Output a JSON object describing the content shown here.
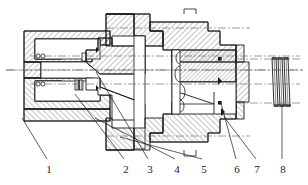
{
  "figure": {
    "kind": "mechanical-cross-section",
    "title": "",
    "background_color": "#ffffff",
    "line_color": "#1a1a1a",
    "hatch_color": "#3a3a3a",
    "centerline_color": "#555555",
    "width": 308,
    "height": 185
  },
  "callouts": [
    {
      "id": "1",
      "label": "1",
      "text_x": 42,
      "text_y": 163,
      "leader": {
        "x1": 47,
        "y1": 159,
        "x2": 22,
        "y2": 118
      }
    },
    {
      "id": "2",
      "label": "2",
      "text_x": 119,
      "text_y": 163,
      "leader": {
        "x1": 124,
        "y1": 159,
        "x2": 75,
        "y2": 94
      }
    },
    {
      "id": "3",
      "label": "3",
      "text_x": 143,
      "text_y": 163,
      "leader": {
        "x1": 148,
        "y1": 159,
        "x2": 96,
        "y2": 72
      }
    },
    {
      "id": "4",
      "label": "4",
      "text_x": 170,
      "text_y": 163,
      "leader": {
        "x1": 175,
        "y1": 159,
        "x2": 95,
        "y2": 118
      }
    },
    {
      "id": "5",
      "label": "5",
      "text_x": 197,
      "text_y": 163,
      "leader": {
        "x1": 202,
        "y1": 159,
        "x2": 120,
        "y2": 137
      }
    },
    {
      "id": "6",
      "label": "6",
      "text_x": 232,
      "text_y": 163,
      "leader": {
        "x1": 236,
        "y1": 159,
        "x2": 221,
        "y2": 103
      }
    },
    {
      "id": "7",
      "label": "7",
      "text_x": 253,
      "text_y": 163,
      "leader": {
        "x1": 256,
        "y1": 159,
        "x2": 224,
        "y2": 117
      }
    },
    {
      "id": "8",
      "label": "8",
      "text_x": 279,
      "text_y": 163,
      "leader": {
        "x1": 282,
        "y1": 159,
        "x2": 282,
        "y2": 106
      }
    }
  ],
  "components": {
    "left_housing": "left end housing body",
    "inner_sleeve": "inner sleeve / bushing",
    "seal_ring": "o-ring seal",
    "piston": "tapered piston / cone",
    "main_body": "main valve body",
    "right_sleeve": "right seat sleeve",
    "right_nut": "retaining nut",
    "spring_stack": "spring / disc washer stack"
  }
}
